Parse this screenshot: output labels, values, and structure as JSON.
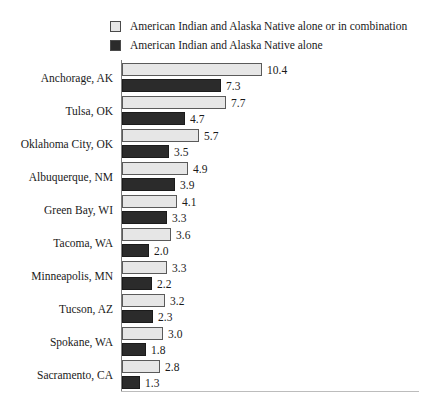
{
  "legend": {
    "items": [
      {
        "label": "American Indian and Alaska Native alone or in combination",
        "swatch": "light-gray-square",
        "color": "#e6e6e6"
      },
      {
        "label": "American Indian  and Alaska Native alone",
        "swatch": "dark-square",
        "color": "#2b2b2b"
      }
    ]
  },
  "chart_data": {
    "type": "bar",
    "orientation": "horizontal",
    "title": "",
    "subtitle": "",
    "xlabel": "",
    "ylabel": "",
    "grid": false,
    "legend_position": "top",
    "xlim": [
      0,
      11
    ],
    "categories": [
      "Anchorage, AK",
      "Tulsa, OK",
      "Oklahoma City, OK",
      "Albuquerque, NM",
      "Green Bay, WI",
      "Tacoma, WA",
      "Minneapolis, MN",
      "Tucson, AZ",
      "Spokane, WA",
      "Sacramento, CA"
    ],
    "series": [
      {
        "name": "American Indian and Alaska Native alone or in combination",
        "color": "#e6e6e6",
        "values": [
          10.4,
          7.7,
          5.7,
          4.9,
          4.1,
          3.6,
          3.3,
          3.2,
          3.0,
          2.8
        ],
        "labels": [
          "10.4",
          "7.7",
          "5.7",
          "4.9",
          "4.1",
          "3.6",
          "3.3",
          "3.2",
          "3.0",
          "2.8"
        ]
      },
      {
        "name": "American Indian  and Alaska Native alone",
        "color": "#2b2b2b",
        "values": [
          7.3,
          4.7,
          3.5,
          3.9,
          3.3,
          2.0,
          2.2,
          2.3,
          1.8,
          1.3
        ],
        "labels": [
          "7.3",
          "4.7",
          "3.5",
          "3.9",
          "3.3",
          "2.0",
          "2.2",
          "2.3",
          "1.8",
          "1.3"
        ]
      }
    ]
  }
}
